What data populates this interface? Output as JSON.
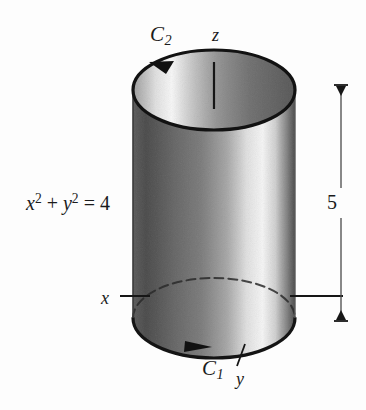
{
  "figure": {
    "background_color": "#fdfdfd",
    "ink_color": "#1b1b1b"
  },
  "labels": {
    "curve_top": "C",
    "curve_top_sub": "2",
    "curve_bottom": "C",
    "curve_bottom_sub": "1",
    "axis_z": "z",
    "axis_y": "y",
    "axis_x": "x",
    "equation_x": "x",
    "equation_x_exp": "2",
    "equation_plus": " + ",
    "equation_y": "y",
    "equation_y_exp": "2",
    "equation_equals": " = 4",
    "height_dimension": "5"
  },
  "geometry": {
    "cylinder": {
      "center_x": 214,
      "radius_x": 81,
      "radius_y": 40,
      "top_center_y": 90,
      "bottom_center_y": 318,
      "height_px": 228,
      "outline_width": 3
    },
    "z_axis": {
      "x": 214,
      "y_top": 62,
      "y_bottom": 108
    },
    "x_leader": {
      "x_start": 120,
      "x_end": 148,
      "y": 296
    },
    "y_leader": {
      "x_start": 236,
      "y_start": 368,
      "x_end": 244,
      "y_end": 345
    },
    "dimension_line": {
      "x": 341,
      "y_top": 85,
      "y_bottom": 321,
      "cap_half_width": 7
    },
    "dimension_leader": {
      "x_start": 293,
      "x_end": 341,
      "y": 296
    }
  },
  "shading": {
    "body_stops": [
      {
        "offset": "0%",
        "color": "#9b9b9b"
      },
      {
        "offset": "8%",
        "color": "#8e8e8e"
      },
      {
        "offset": "26%",
        "color": "#a4a4a4"
      },
      {
        "offset": "42%",
        "color": "#b3b3b3"
      },
      {
        "offset": "58%",
        "color": "#cfcfcf"
      },
      {
        "offset": "70%",
        "color": "#efefef"
      },
      {
        "offset": "80%",
        "color": "#fafafa"
      },
      {
        "offset": "88%",
        "color": "#e6e6e6"
      },
      {
        "offset": "95%",
        "color": "#b8b8b8"
      },
      {
        "offset": "100%",
        "color": "#8f8f8f"
      }
    ],
    "top_face_stops": [
      {
        "offset": "0%",
        "color": "#c9c9c9"
      },
      {
        "offset": "14%",
        "color": "#efefef"
      },
      {
        "offset": "24%",
        "color": "#fbfbfb"
      },
      {
        "offset": "36%",
        "color": "#e2e2e2"
      },
      {
        "offset": "52%",
        "color": "#c3c3c3"
      },
      {
        "offset": "72%",
        "color": "#ababab"
      },
      {
        "offset": "100%",
        "color": "#989898"
      }
    ]
  },
  "annotations": {
    "arrow_top_note": "arrowhead on top ellipse pointing clockwise (rightward) near upper-left",
    "arrow_bottom_note": "arrowhead on bottom ellipse pointing rightward near lower-left",
    "hidden_edge_note": "back half of bottom ellipse drawn dashed on the right side"
  }
}
